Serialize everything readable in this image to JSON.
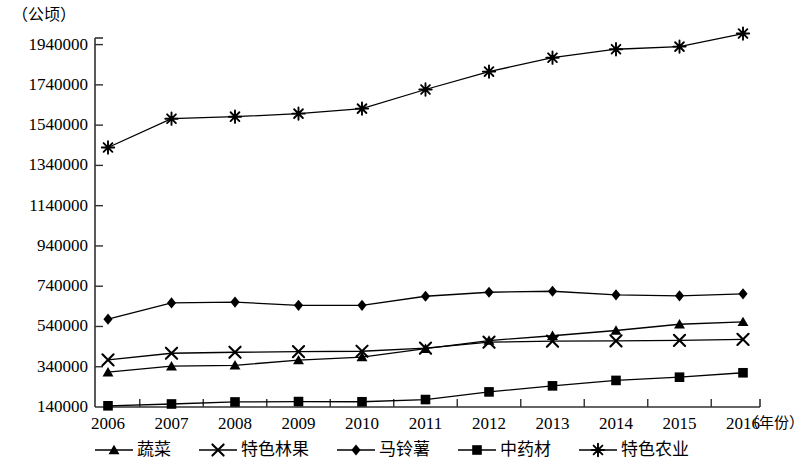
{
  "axes": {
    "unit_label": "（公顷）",
    "x_axis_title": "（年份）",
    "y_ticks": [
      "1940000",
      "1740000",
      "1540000",
      "1340000",
      "1140000",
      "940000",
      "740000",
      "540000",
      "340000",
      "140000"
    ],
    "x_ticks": [
      "2006",
      "2007",
      "2008",
      "2009",
      "2010",
      "2011",
      "2012",
      "2013",
      "2014",
      "2015",
      "2016"
    ]
  },
  "legend": {
    "items": [
      {
        "label": "蔬菜",
        "marker": "triangle-marker",
        "color": "#000000"
      },
      {
        "label": "特色林果",
        "marker": "cross-marker",
        "color": "#000000"
      },
      {
        "label": "马铃薯",
        "marker": "diamond-marker",
        "color": "#000000"
      },
      {
        "label": "中药材",
        "marker": "square-marker",
        "color": "#000000"
      },
      {
        "label": "特色农业",
        "marker": "asterisk-marker",
        "color": "#000000"
      }
    ]
  },
  "chart_data": {
    "type": "line",
    "title": "",
    "subtitle": "",
    "xlabel": "（年份）",
    "ylabel": "（公顷）",
    "grid": false,
    "legend_position": "bottom",
    "x": [
      2006,
      2007,
      2008,
      2009,
      2010,
      2011,
      2012,
      2013,
      2014,
      2015,
      2016
    ],
    "categories": [
      "2006",
      "2007",
      "2008",
      "2009",
      "2010",
      "2011",
      "2012",
      "2013",
      "2014",
      "2015",
      "2016"
    ],
    "xlim": [
      2006,
      2016
    ],
    "ylim": [
      140000,
      1940000
    ],
    "ytick_values": [
      140000,
      340000,
      540000,
      740000,
      940000,
      1140000,
      1340000,
      1540000,
      1740000,
      1940000
    ],
    "series": [
      {
        "name": "蔬菜",
        "marker": "triangle",
        "color": "#000000",
        "values": [
          313000,
          343000,
          347000,
          373000,
          388000,
          430000,
          470000,
          494000,
          520000,
          551000,
          563000
        ]
      },
      {
        "name": "特色林果",
        "marker": "cross",
        "color": "#000000",
        "values": [
          374000,
          407000,
          412000,
          415000,
          417000,
          432000,
          462000,
          467000,
          468000,
          471000,
          476000
        ]
      },
      {
        "name": "马铃薯",
        "marker": "diamond",
        "color": "#000000",
        "values": [
          576000,
          657000,
          661000,
          645000,
          645000,
          690000,
          710000,
          715000,
          697000,
          692000,
          702000
        ]
      },
      {
        "name": "中药材",
        "marker": "square",
        "color": "#000000",
        "values": [
          146000,
          155000,
          165000,
          167000,
          166000,
          177000,
          215000,
          245000,
          272000,
          288000,
          310000
        ]
      },
      {
        "name": "特色农业",
        "marker": "asterisk",
        "color": "#000000",
        "values": [
          1429000,
          1572000,
          1582000,
          1597000,
          1622000,
          1717000,
          1806000,
          1875000,
          1917000,
          1930000,
          1995000
        ]
      }
    ]
  }
}
